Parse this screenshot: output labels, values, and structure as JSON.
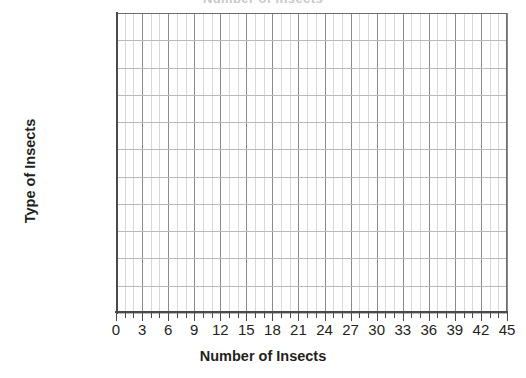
{
  "chart_data": {
    "type": "bar",
    "orientation": "horizontal",
    "title": "Number of Insects",
    "xlabel": "Number of Insects",
    "ylabel": "Type of Insects",
    "categories": [
      "Ant",
      "Bee",
      "Beetle",
      "Butterfly",
      "Dragonfly"
    ],
    "values": [
      0,
      0,
      0,
      0,
      0
    ],
    "xlim": [
      0,
      45
    ],
    "xticks": [
      0,
      3,
      6,
      9,
      12,
      15,
      18,
      21,
      24,
      27,
      30,
      33,
      36,
      39,
      42,
      45
    ],
    "xtick_labels": [
      "0",
      "3",
      "6",
      "9",
      "12",
      "15",
      "18",
      "21",
      "24",
      "27",
      "30",
      "33",
      "36",
      "39",
      "42",
      "45"
    ],
    "x_minor_tick_interval": 1,
    "grid": true,
    "grid_axis": "both",
    "legend": false,
    "note": "Blank grid template; no bars are drawn for any category",
    "colors": {
      "background": "#ffffff",
      "major_gridline": "#8b8b8b",
      "minor_gridline": "#d9d9d9",
      "row_gridline": "#b9b9b9",
      "axis": "#4a4a4a",
      "text": "#231f20"
    }
  }
}
